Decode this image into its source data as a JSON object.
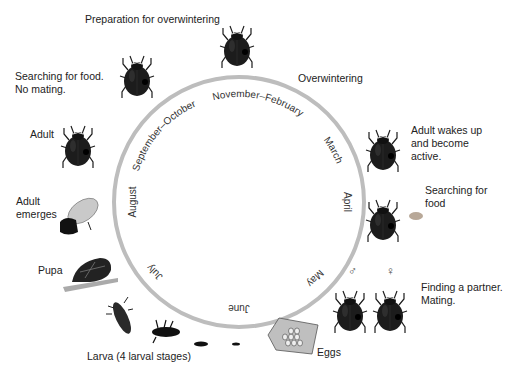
{
  "colors": {
    "ring": "#bdbdbd",
    "beetle": "#1c1c1c",
    "text": "#222222"
  },
  "months": {
    "nov_feb": "November–February",
    "march": "March",
    "april": "April",
    "may": "May",
    "june": "June",
    "july": "July",
    "august": "August",
    "sep_oct": "September–October"
  },
  "stages": {
    "prep": "Preparation for overwintering",
    "overwintering": "Overwintering",
    "wakes_1": "Adult wakes up",
    "wakes_2": "and become",
    "wakes_3": "active.",
    "search_food_1": "Searching for",
    "search_food_2": "food",
    "partner_1": "Finding a partner.",
    "partner_2": "Mating.",
    "eggs": "Eggs",
    "larva": "Larva (4 larval stages)",
    "pupa": "Pupa",
    "emerges_1": "Adult",
    "emerges_2": "emerges",
    "adult": "Adult",
    "search_nomate_1": "Searching for food.",
    "search_nomate_2": "No mating."
  },
  "symbols": {
    "male": "♂",
    "female": "♀"
  }
}
